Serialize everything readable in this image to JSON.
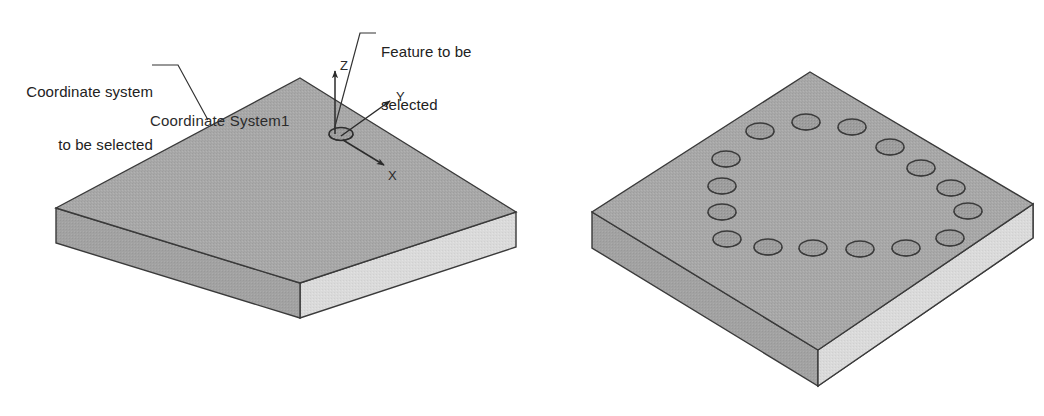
{
  "figure": {
    "type": "technical-isometric-diagram",
    "background_color": "#ffffff",
    "width": 1044,
    "height": 416
  },
  "annotations": {
    "coordinate_system_callout": {
      "line1": "Coordinate system",
      "line2": "to be selected",
      "full_text": "Coordinate system to be selected"
    },
    "feature_callout": {
      "line1": "Feature to be",
      "line2": "selected",
      "full_text": "Feature to be selected"
    },
    "coordinate_system_name": "Coordinate System1"
  },
  "axes": {
    "x_label": "X",
    "y_label": "Y",
    "z_label": "Z"
  },
  "parts": {
    "left_plate": {
      "name": "plate-without-holes",
      "hole_count": 1,
      "holes_description": "single hole at coordinate system origin"
    },
    "right_plate": {
      "name": "plate-with-circular-hole-pattern",
      "hole_count": 16,
      "holes_description": "circular bolt-hole pattern of 16 holes"
    }
  },
  "colors": {
    "top_face": "#a8a8a8",
    "left_face": "#a0a0a0",
    "right_face": "#d8d8d8",
    "outline": "#3a3a3a",
    "hole_fill": "#9b9b9b",
    "hole_stroke": "#444444",
    "text": "#222222",
    "leader": "#333333",
    "background": "#ffffff"
  }
}
